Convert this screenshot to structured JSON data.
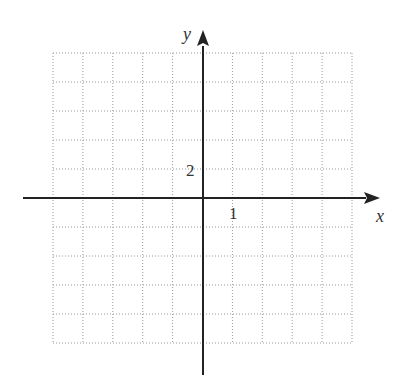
{
  "chart_data": {
    "type": "blank-coordinate-grid",
    "title": "",
    "xlabel": "x",
    "ylabel": "y",
    "grid": true,
    "grid_style": "dotted",
    "grid_columns": 10,
    "grid_rows": 10,
    "x_tick_labels": [
      {
        "value": 1,
        "text": "1"
      }
    ],
    "y_tick_labels": [
      {
        "value": 2,
        "text": "2"
      }
    ],
    "x_scale_per_cell": 1,
    "y_scale_per_cell": 2,
    "xlim": [
      -5,
      5
    ],
    "ylim": [
      -10,
      10
    ]
  },
  "labels": {
    "x_axis": "x",
    "y_axis": "y",
    "x_tick": "1",
    "y_tick": "2"
  },
  "colors": {
    "axis": "#222222",
    "grid": "#9a9a9a",
    "text": "#333333"
  }
}
